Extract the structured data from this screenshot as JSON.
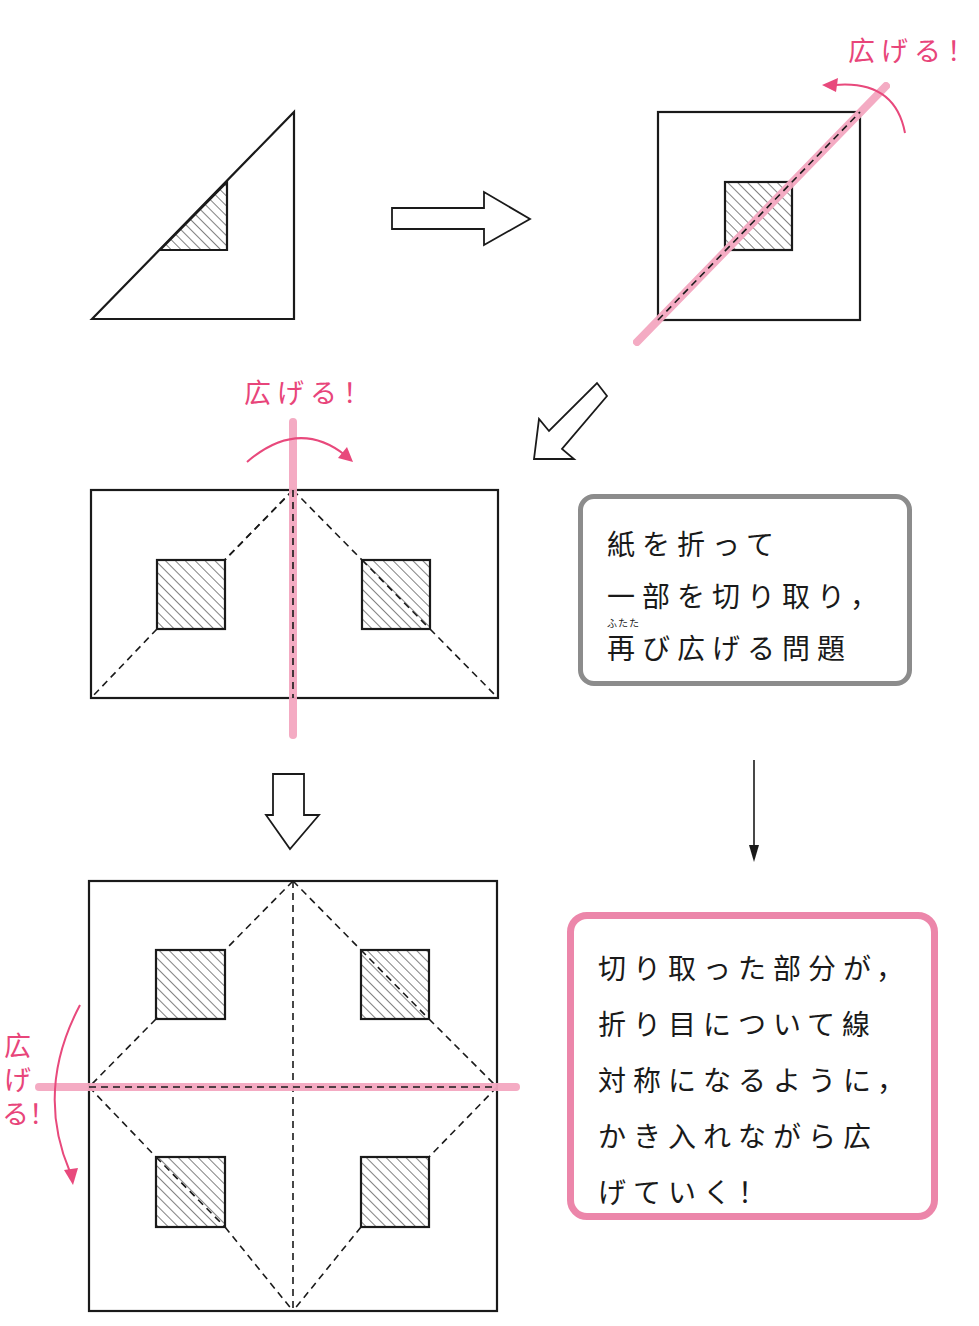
{
  "colors": {
    "ink": "#1a1a1a",
    "accent_pink_text": "#e8457a",
    "accent_pink_line": "#f4a7c0",
    "pink_box_border": "#ec86aa",
    "gray_box_border": "#8c8c8c"
  },
  "labels": {
    "unfold_1": "広げる！",
    "unfold_2": "広げる！",
    "unfold_3": "広げる！"
  },
  "gray_box": {
    "ruby": "ふたた",
    "lines": [
      "紙を折って",
      "一部を切り取り，",
      "再び広げる問題"
    ]
  },
  "pink_box": {
    "lines": [
      "切り取った部分が，",
      "折り目について線",
      "対称になるように，",
      "かき入れながら広",
      "げていく！"
    ]
  },
  "steps": [
    {
      "name": "folded-triangle",
      "shape": "right triangle",
      "cutout": "hatched triangle"
    },
    {
      "name": "unfold-diagonal",
      "shape": "square",
      "cutout": "1 hatched square",
      "fold_line": "diagonal"
    },
    {
      "name": "unfold-vertical",
      "shape": "rectangle",
      "cutout": "2 hatched squares",
      "fold_line": "vertical"
    },
    {
      "name": "unfold-horizontal",
      "shape": "square",
      "cutout": "4 hatched squares",
      "fold_line": "horizontal"
    }
  ]
}
